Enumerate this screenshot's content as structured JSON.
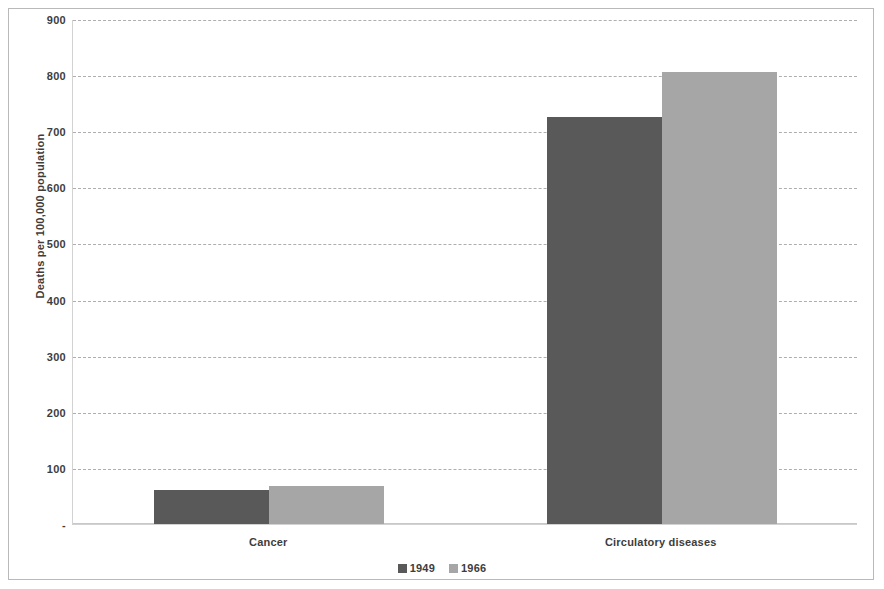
{
  "chart_data": {
    "type": "bar",
    "title": "",
    "subtitle": "",
    "xlabel": "",
    "ylabel": "Deaths per 100,000 population",
    "categories": [
      "Cancer",
      "Circulatory diseases"
    ],
    "series": [
      {
        "name": "1949",
        "color": "#595959",
        "values": [
          60,
          725
        ]
      },
      {
        "name": "1966",
        "color": "#a6a6a6",
        "values": [
          68,
          805
        ]
      }
    ],
    "ylim": [
      0,
      900
    ],
    "ytick_values": [
      0,
      100,
      200,
      300,
      400,
      500,
      600,
      700,
      800,
      900
    ],
    "ytick_labels": [
      "-",
      "100",
      "200",
      "300",
      "400",
      "500",
      "600",
      "700",
      "800",
      "900"
    ],
    "grid": true,
    "grid_style": "dashed",
    "grid_axis": "y",
    "legend_position": "bottom",
    "bar_gap_within_group": 0,
    "background_color": "#ffffff",
    "axis_color": "#d2d2d2",
    "gridline_color": "#aeaeae",
    "text_color": "#3d3d3d"
  }
}
